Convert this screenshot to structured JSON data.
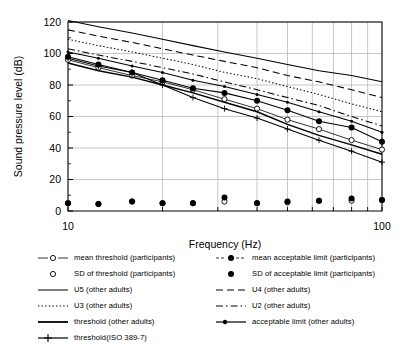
{
  "chart_data": {
    "type": "line",
    "title": "",
    "xlabel": "Frequency (Hz)",
    "ylabel": "Sound pressure level (dB)",
    "xscale": "log",
    "xlim": [
      10,
      100
    ],
    "ylim": [
      0,
      120
    ],
    "yticks": [
      0,
      20,
      40,
      60,
      80,
      100,
      120
    ],
    "xticks": [
      10,
      100
    ],
    "xgridlines": [
      10,
      20,
      30,
      40,
      50,
      60,
      70,
      80,
      90,
      100
    ],
    "grid": true,
    "legend_position": "below",
    "x": [
      10,
      12.5,
      16,
      20,
      25,
      31.5,
      40,
      50,
      63,
      80,
      100
    ],
    "series": [
      {
        "name": "mean threshold   (participants)",
        "style": "line-open-circle",
        "group": "participants",
        "values": [
          96,
          91,
          86,
          82,
          77,
          71,
          65,
          58,
          52,
          45,
          39
        ]
      },
      {
        "name": "SD of threshold   (participants)",
        "style": "open-circle",
        "group": "participants",
        "values": [
          5,
          4.5,
          6,
          5,
          5,
          6,
          5,
          5.5,
          6.5,
          6.5,
          7
        ]
      },
      {
        "name": "mean acceptable limit (participants)",
        "style": "line-filled-circle",
        "group": "participants",
        "values": [
          98,
          93,
          88,
          83,
          78,
          75,
          70,
          64,
          57,
          53,
          44
        ]
      },
      {
        "name": "SD of acceptable limit (participants)",
        "style": "filled-circle",
        "group": "participants",
        "values": [
          5,
          4.5,
          6,
          5,
          5,
          8.5,
          5,
          6,
          6.5,
          8,
          7
        ]
      },
      {
        "name": "U5 (other adults)",
        "style": "solid",
        "group": "other-adults",
        "values": [
          121,
          117,
          113,
          109,
          105,
          101,
          97,
          93,
          89,
          86,
          82
        ]
      },
      {
        "name": "U4 (other adults)",
        "style": "dashed",
        "group": "other-adults",
        "values": [
          115,
          111,
          107,
          103,
          99,
          95,
          91,
          86,
          82,
          77,
          72
        ]
      },
      {
        "name": "U3 (other adults)",
        "style": "dotted",
        "group": "other-adults",
        "values": [
          109,
          105,
          101,
          97,
          93,
          88,
          84,
          79,
          74,
          68,
          63
        ]
      },
      {
        "name": "U2 (other adults)",
        "style": "dash-dot",
        "group": "other-adults",
        "values": [
          103,
          99,
          95,
          91,
          87,
          82,
          77,
          72,
          67,
          60,
          54
        ]
      },
      {
        "name": "threshold (other adults)",
        "style": "solid-thick",
        "group": "other-adults",
        "values": [
          94,
          89,
          85,
          80,
          75,
          69,
          63,
          55,
          48,
          42,
          36
        ]
      },
      {
        "name": "acceptable limit  (other adults)",
        "style": "solid-dot-marker",
        "group": "other-adults",
        "values": [
          101,
          97,
          92,
          88,
          83,
          79,
          74,
          69,
          63,
          57,
          50
        ]
      },
      {
        "name": "threshold(ISO 389-7)",
        "style": "solid-plus-marker",
        "group": "iso",
        "values": [
          97,
          92,
          88,
          80,
          72,
          65,
          59,
          52,
          45,
          38,
          31
        ]
      }
    ]
  },
  "axes": {
    "ylabel": "Sound pressure level (dB)",
    "xlabel": "Frequency (Hz)",
    "ytick_labels": [
      "0",
      "20",
      "40",
      "60",
      "80",
      "100",
      "120"
    ],
    "xtick_labels": [
      "10",
      "100"
    ]
  },
  "legend": {
    "left": [
      {
        "key": "line-open-circle",
        "label": "mean threshold   (participants)"
      },
      {
        "key": "open-circle",
        "label": "SD of threshold   (participants)"
      },
      {
        "key": "solid",
        "label": "U5 (other adults)"
      },
      {
        "key": "dotted",
        "label": "U3 (other adults)"
      },
      {
        "key": "solid-thick",
        "label": "threshold (other adults)"
      },
      {
        "key": "solid-plus-marker",
        "label": "threshold(ISO 389-7)"
      }
    ],
    "right": [
      {
        "key": "line-filled-circle",
        "label": "mean acceptable limit (participants)"
      },
      {
        "key": "filled-circle",
        "label": "SD of acceptable limit (participants)"
      },
      {
        "key": "dashed",
        "label": "U4 (other adults)"
      },
      {
        "key": "dash-dot",
        "label": "U2 (other adults)"
      },
      {
        "key": "solid-dot-marker",
        "label": "acceptable limit  (other adults)"
      }
    ]
  },
  "colors": {
    "foreground": "#000000",
    "grid": "#b9b9b9",
    "background": "#ffffff"
  }
}
